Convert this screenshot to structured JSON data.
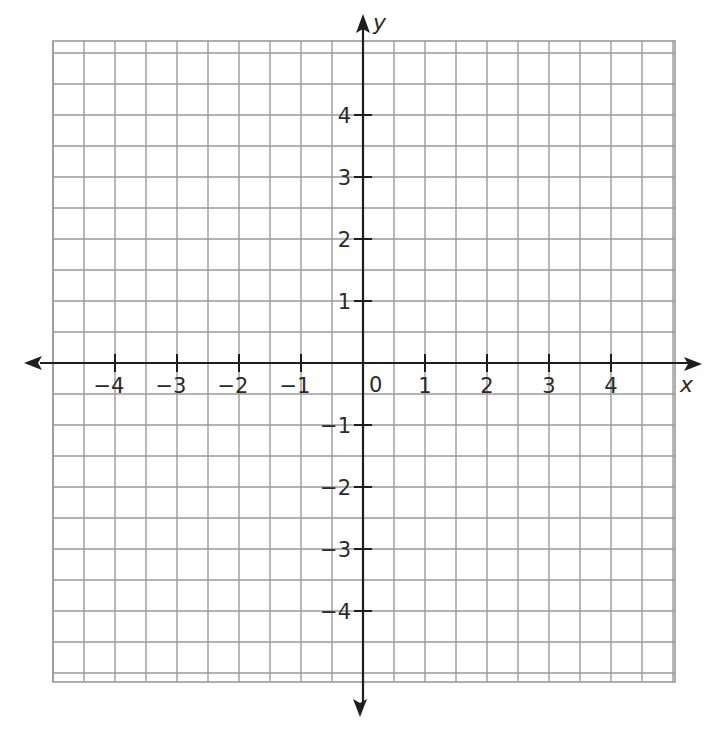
{
  "chart_data": {
    "type": "scatter",
    "title": "",
    "xlabel": "x",
    "ylabel": "y",
    "xlim": [
      -5,
      5
    ],
    "ylim": [
      -5,
      5
    ],
    "grid": true,
    "grid_step": 0.5,
    "x_ticks": [
      -4,
      -3,
      -2,
      -1,
      1,
      2,
      3,
      4
    ],
    "y_ticks": [
      -4,
      -3,
      -2,
      -1,
      1,
      2,
      3,
      4
    ],
    "x_tick_labels": [
      "−4",
      "−3",
      "−2",
      "−1",
      "1",
      "2",
      "3",
      "4"
    ],
    "y_tick_labels": [
      "−4",
      "−3",
      "−2",
      "−1",
      "1",
      "2",
      "3",
      "4"
    ],
    "origin_label": "0",
    "series": [],
    "legend": null
  },
  "style": {
    "grid_color": "#9a9a9a",
    "axis_color": "#1e1e1e",
    "text_color": "#2a2a2a"
  }
}
